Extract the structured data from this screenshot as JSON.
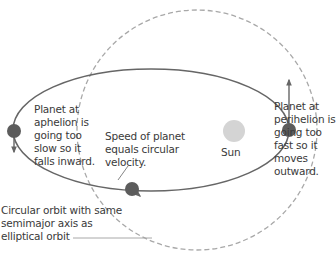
{
  "diagram": {
    "labels": {
      "aphelion": "Planet at\naphelion is\ngoing too\nslow so it\nfalls inward.",
      "perihelion": "Planet at\nperihelion is\ngoing too\nfast so it\nmoves\noutward.",
      "circular_speed": "Speed of planet\nequals circular\nvelocity.",
      "sun": "Sun",
      "circular_orbit": "Circular orbit with same\nsemimajor axis as\nelliptical orbit"
    },
    "colors": {
      "orbit": "#666666",
      "circle_dashed": "#a8a8a8",
      "planet": "#5c5c5c",
      "sun": "#d4d4d4",
      "text": "#3a3a3a"
    },
    "elements": {
      "elliptical_orbit": {
        "cx": 151,
        "cy": 130,
        "rx": 138,
        "ry": 61
      },
      "circular_orbit": {
        "cx": 197,
        "cy": 130,
        "r": 120
      },
      "sun": {
        "cx": 234,
        "cy": 131,
        "r": 11
      },
      "planets": [
        {
          "name": "aphelion",
          "cx": 14,
          "cy": 131
        },
        {
          "name": "perihelion",
          "cx": 289,
          "cy": 130
        },
        {
          "name": "intersection",
          "cx": 132,
          "cy": 189
        }
      ]
    }
  }
}
